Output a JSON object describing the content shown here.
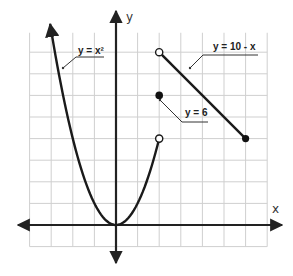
{
  "chart_data": {
    "type": "line",
    "title": "",
    "xlabel": "x",
    "ylabel": "y",
    "xlim": [
      -4,
      7
    ],
    "ylim": [
      -1,
      9
    ],
    "grid": true,
    "grid_unit": 1,
    "tick_labels": "none",
    "series": [
      {
        "name": "y = x²",
        "label": "y = x²",
        "kind": "curve",
        "function": "x^2",
        "domain": [
          -3.05,
          2
        ],
        "left_end": "arrow",
        "right_end": "open",
        "points": [
          [
            -3,
            9
          ],
          [
            -2,
            4
          ],
          [
            -1,
            1
          ],
          [
            0,
            0
          ],
          [
            1,
            1
          ],
          [
            2,
            4
          ]
        ]
      },
      {
        "name": "y = 10 - x",
        "label": "y = 10 - x",
        "kind": "segment",
        "function": "10 - x",
        "domain": [
          2,
          6
        ],
        "left_end": "open",
        "right_end": "closed",
        "points": [
          [
            2,
            8
          ],
          [
            6,
            4
          ]
        ]
      },
      {
        "name": "y = 6",
        "label": "y = 6",
        "kind": "point",
        "closed": true,
        "points": [
          [
            2,
            6
          ]
        ]
      }
    ],
    "annotations": [
      {
        "text": "y = x²",
        "points_to": [
          -2.8,
          7.8
        ]
      },
      {
        "text": "y = 10 - x",
        "points_to": [
          3.6,
          6.4
        ]
      },
      {
        "text": "y = 6",
        "points_to": [
          2.2,
          5.6
        ]
      }
    ],
    "legend": "none (inline leader-line labels)"
  },
  "labels": {
    "x_axis": "x",
    "y_axis": "y",
    "parabola": "y = x²",
    "line": "y = 10 - x",
    "point": "y = 6"
  }
}
